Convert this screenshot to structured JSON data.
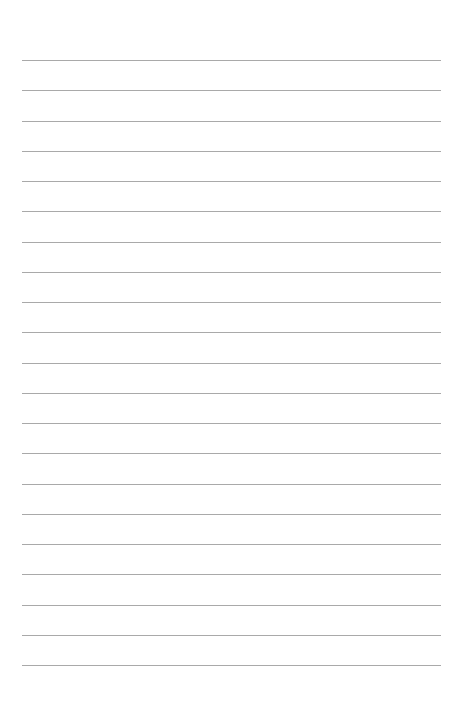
{
  "page": {
    "type": "lined-paper",
    "background_color": "#ffffff",
    "line_color": "#a9a9a9",
    "line_count": 21,
    "first_line_y": 60,
    "line_spacing": 30.25,
    "line_left": 22,
    "line_width": 419,
    "text": ""
  }
}
